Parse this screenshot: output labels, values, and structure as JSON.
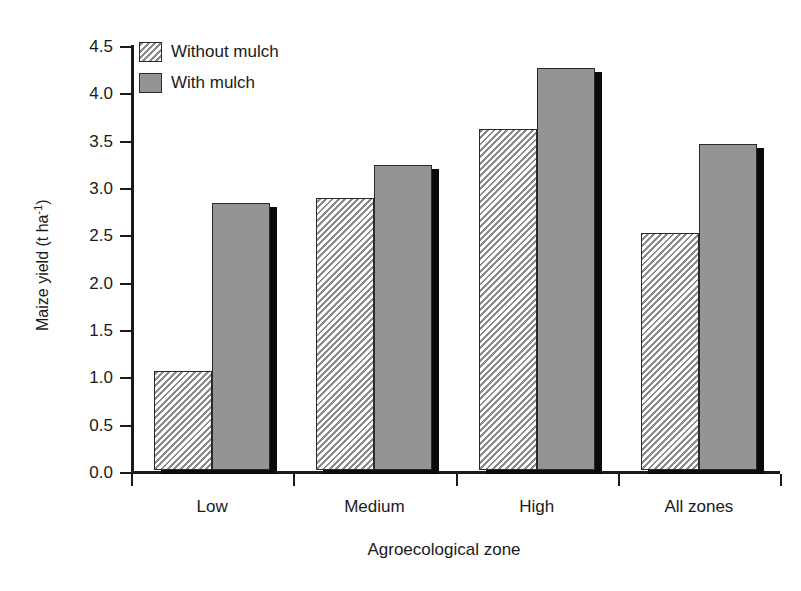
{
  "chart_data": {
    "type": "bar",
    "title": "",
    "subtitle": "",
    "xlabel": "Agroecological zone",
    "ylabel": "Maize yield (t ha",
    "ylabel_sup": "-1",
    "ylabel_tail": ")",
    "categories": [
      "Low",
      "Medium",
      "High",
      "All zones"
    ],
    "series": [
      {
        "name": "Without mulch",
        "style": "hatched",
        "values": [
          1.05,
          2.87,
          3.6,
          2.5
        ]
      },
      {
        "name": "With mulch",
        "style": "solid-gray",
        "values": [
          2.82,
          3.22,
          4.25,
          3.44
        ]
      }
    ],
    "ylim": [
      0.0,
      4.5
    ],
    "ytick_step": 0.5,
    "yticks": [
      "0.0",
      "0.5",
      "1.0",
      "1.5",
      "2.0",
      "2.5",
      "3.0",
      "3.5",
      "4.0",
      "4.5"
    ],
    "grid": false,
    "legend_position": "top-left-inside",
    "colors": {
      "bar_solid": "#949494",
      "bar_hatch_line": "#8a8a8a",
      "bar_outline": "#2a2a2a",
      "shadow": "#0a0a0a",
      "axis": "#1a1a1a",
      "background": "#ffffff"
    }
  }
}
